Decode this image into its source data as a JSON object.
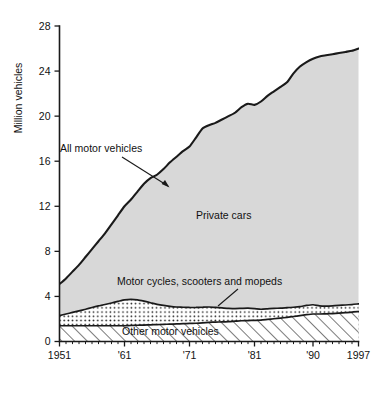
{
  "chart_data": {
    "type": "area",
    "title": "",
    "subtitle": "",
    "xlabel": "",
    "ylabel": "Million vehicles",
    "ylim": [
      0,
      28
    ],
    "xlim": [
      1951,
      1997
    ],
    "yticks": [
      0,
      4,
      8,
      12,
      16,
      20,
      24,
      28
    ],
    "ytick_labels": [
      "0",
      "4",
      "8",
      "12",
      "16",
      "20",
      "24",
      "28"
    ],
    "xticks": [
      1951,
      1961,
      1971,
      1981,
      1990,
      1997
    ],
    "xtick_labels": [
      "1951",
      "'61",
      "'71",
      "'81",
      "'90",
      "1997"
    ],
    "minor_xtick_interval": 1,
    "grid": false,
    "legend_position": "inline-annotations",
    "stacking": "stacked-from-bottom",
    "annotations": [
      {
        "id": "all-motor-vehicles",
        "text": "All motor vehicles",
        "kind": "arrow-label",
        "target_series": "All motor vehicles"
      },
      {
        "id": "private-cars",
        "text": "Private cars",
        "kind": "inline-band-label",
        "target_series": "Private cars"
      },
      {
        "id": "motor-cycles",
        "text": "Motor cycles, scooters and mopeds",
        "kind": "leader-label",
        "target_series": "Motor cycles, scooters and mopeds"
      },
      {
        "id": "other-motor-vehicles",
        "text": "Other motor vehicles",
        "kind": "inline-band-label",
        "target_series": "Other motor vehicles"
      }
    ],
    "x": [
      1951,
      1952,
      1953,
      1954,
      1955,
      1956,
      1957,
      1958,
      1959,
      1960,
      1961,
      1962,
      1963,
      1964,
      1965,
      1966,
      1967,
      1968,
      1969,
      1970,
      1971,
      1972,
      1973,
      1974,
      1975,
      1976,
      1977,
      1978,
      1979,
      1980,
      1981,
      1982,
      1983,
      1984,
      1985,
      1986,
      1987,
      1988,
      1989,
      1990,
      1991,
      1992,
      1993,
      1994,
      1995,
      1996,
      1997
    ],
    "series": [
      {
        "name": "Other motor vehicles",
        "fill": "diagonal-hatch",
        "cumulative_top": [
          1.4,
          1.4,
          1.4,
          1.4,
          1.4,
          1.4,
          1.4,
          1.4,
          1.4,
          1.4,
          1.4,
          1.42,
          1.44,
          1.46,
          1.48,
          1.5,
          1.52,
          1.54,
          1.56,
          1.58,
          1.6,
          1.62,
          1.66,
          1.7,
          1.72,
          1.74,
          1.76,
          1.8,
          1.84,
          1.86,
          1.88,
          1.9,
          1.96,
          2.02,
          2.08,
          2.14,
          2.22,
          2.3,
          2.38,
          2.44,
          2.44,
          2.46,
          2.48,
          2.52,
          2.56,
          2.6,
          2.66
        ]
      },
      {
        "name": "Motor cycles, scooters and mopeds",
        "fill": "dotted-stipple",
        "cumulative_top": [
          2.3,
          2.44,
          2.58,
          2.72,
          2.86,
          3.02,
          3.16,
          3.28,
          3.42,
          3.56,
          3.7,
          3.74,
          3.7,
          3.58,
          3.44,
          3.3,
          3.2,
          3.12,
          3.06,
          3.04,
          3.02,
          3.02,
          3.04,
          3.06,
          3.02,
          2.98,
          2.94,
          2.92,
          2.94,
          2.96,
          2.92,
          2.86,
          2.9,
          2.94,
          2.96,
          3.0,
          3.04,
          3.1,
          3.2,
          3.26,
          3.16,
          3.14,
          3.16,
          3.2,
          3.24,
          3.28,
          3.34
        ]
      },
      {
        "name": "Private cars",
        "fill": "light-gray",
        "cumulative_top": [
          5.1,
          5.6,
          6.2,
          6.8,
          7.5,
          8.2,
          8.9,
          9.6,
          10.4,
          11.2,
          12.0,
          12.6,
          13.3,
          14.0,
          14.5,
          14.8,
          15.3,
          15.9,
          16.4,
          16.9,
          17.3,
          18.1,
          18.9,
          19.2,
          19.4,
          19.7,
          20.0,
          20.3,
          20.8,
          21.1,
          21.0,
          21.3,
          21.8,
          22.2,
          22.6,
          23.0,
          23.8,
          24.4,
          24.8,
          25.1,
          25.3,
          25.4,
          25.5,
          25.6,
          25.7,
          25.8,
          26.0
        ]
      }
    ],
    "series_total_name": "All motor vehicles"
  },
  "colors": {
    "private_cars_fill": "#d8d8d8",
    "line": "#1a1a1a",
    "background": "#ffffff",
    "hatch": "#1a1a1a",
    "stipple": "#1a1a1a"
  }
}
